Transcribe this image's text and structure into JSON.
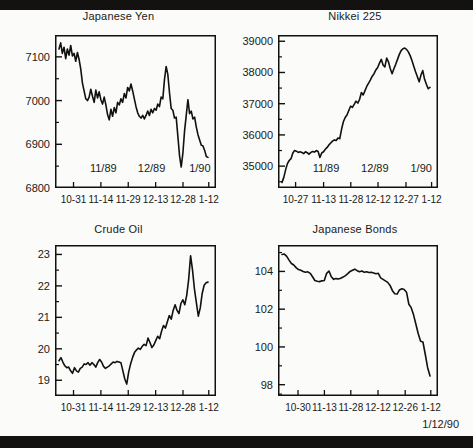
{
  "figure": {
    "caption": "1/12/90",
    "band_color": "#141210",
    "paper_color": "#fbfbf9",
    "ink_color": "#111111"
  },
  "chart_data": [
    {
      "id": "japanese-yen",
      "type": "line",
      "title": "Japanese Yen",
      "xlabel": "",
      "ylabel": "",
      "ylim": [
        6800,
        7150
      ],
      "yticks": [
        6800,
        6900,
        7000,
        7100
      ],
      "ytick_labels": [
        "6800",
        "6900",
        "7000",
        "7100"
      ],
      "minor_yticks": [
        6850,
        6950,
        7050,
        7150
      ],
      "grid": false,
      "legend": "none",
      "inner_xlabels": [
        "11/89",
        "12/89",
        "1/90"
      ],
      "inner_xlabel_positions": [
        0.3,
        0.6,
        0.9
      ],
      "xtick_labels": [
        "10-31",
        "11-14",
        "11-29",
        "12-13",
        "12-28",
        "1-12"
      ],
      "xtick_positions": [
        0.115,
        0.285,
        0.455,
        0.625,
        0.795,
        0.955
      ],
      "values": [
        7118,
        7132,
        7108,
        7122,
        7096,
        7118,
        7104,
        7126,
        7102,
        7108,
        7090,
        7110,
        7094,
        7072,
        7040,
        7022,
        7004,
        7000,
        7008,
        7026,
        7010,
        6996,
        7024,
        7006,
        7020,
        7002,
        6992,
        7008,
        6990,
        6968,
        6956,
        6980,
        6964,
        6984,
        6972,
        6996,
        6990,
        7004,
        6996,
        7016,
        7006,
        7030,
        7022,
        7038,
        7022,
        7004,
        6986,
        6972,
        6964,
        6960,
        6966,
        6958,
        6966,
        6976,
        6966,
        6980,
        6972,
        6982,
        6978,
        6992,
        6986,
        7008,
        7004,
        7048,
        7078,
        7060,
        7018,
        6982,
        6978,
        6960,
        6962,
        6918,
        6874,
        6848,
        6880,
        6930,
        6966,
        7002,
        6970,
        6976,
        6958,
        6962,
        6940,
        6922,
        6910,
        6898,
        6896,
        6886,
        6872,
        6870
      ]
    },
    {
      "id": "nikkei-225",
      "type": "line",
      "title": "Nikkei 225",
      "xlabel": "",
      "ylabel": "",
      "ylim": [
        34300,
        39200
      ],
      "yticks": [
        35000,
        36000,
        37000,
        38000,
        39000
      ],
      "ytick_labels": [
        "35000",
        "36000",
        "37000",
        "38000",
        "39000"
      ],
      "minor_yticks": [
        34500,
        35500,
        36500,
        37500,
        38500
      ],
      "grid": false,
      "legend": "none",
      "inner_xlabels": [
        "11/89",
        "12/89",
        "1/90"
      ],
      "inner_xlabel_positions": [
        0.3,
        0.605,
        0.895
      ],
      "xtick_labels": [
        "10-27",
        "11-13",
        "11-28",
        "12-12",
        "12-27",
        "1-12"
      ],
      "xtick_positions": [
        0.11,
        0.285,
        0.455,
        0.625,
        0.8,
        0.96
      ],
      "values": [
        34480,
        34640,
        34880,
        35080,
        35180,
        35240,
        35420,
        35500,
        35480,
        35440,
        35460,
        35440,
        35400,
        35460,
        35430,
        35380,
        35440,
        35470,
        35450,
        35500,
        35470,
        35280,
        35420,
        35460,
        35540,
        35600,
        35680,
        35740,
        35800,
        35840,
        35820,
        35900,
        35880,
        36180,
        36420,
        36560,
        36640,
        36780,
        36920,
        36880,
        36980,
        37080,
        37020,
        37140,
        37360,
        37280,
        37420,
        37560,
        37660,
        37760,
        37880,
        37960,
        38080,
        38160,
        38300,
        38420,
        38240,
        38180,
        38460,
        38340,
        38120,
        37960,
        38120,
        38260,
        38420,
        38580,
        38700,
        38760,
        38780,
        38740,
        38660,
        38540,
        38380,
        38200,
        38020,
        37860,
        37700,
        37920,
        38060,
        37780,
        37620,
        37480,
        37520
      ]
    },
    {
      "id": "crude-oil",
      "type": "line",
      "title": "Crude Oil",
      "xlabel": "",
      "ylabel": "",
      "ylim": [
        18.5,
        23.3
      ],
      "yticks": [
        19,
        20,
        21,
        22,
        23
      ],
      "ytick_labels": [
        "19",
        "20",
        "21",
        "22",
        "23"
      ],
      "minor_yticks": [
        18.5,
        19.5,
        20.5,
        21.5,
        22.5
      ],
      "grid": false,
      "legend": "none",
      "inner_xlabels": [],
      "inner_xlabel_positions": [],
      "xtick_labels": [
        "10-31",
        "11-14",
        "11-29",
        "12-13",
        "12-28",
        "1-12"
      ],
      "xtick_positions": [
        0.115,
        0.285,
        0.455,
        0.625,
        0.795,
        0.955
      ],
      "values": [
        19.62,
        19.72,
        19.58,
        19.46,
        19.4,
        19.42,
        19.3,
        19.22,
        19.4,
        19.3,
        19.26,
        19.38,
        19.42,
        19.52,
        19.5,
        19.56,
        19.48,
        19.56,
        19.5,
        19.42,
        19.56,
        19.66,
        19.58,
        19.44,
        19.38,
        19.42,
        19.46,
        19.52,
        19.58,
        19.56,
        19.6,
        19.58,
        19.56,
        19.3,
        19.04,
        18.88,
        19.26,
        19.52,
        19.72,
        19.88,
        19.96,
        20.02,
        19.98,
        20.08,
        20.14,
        20.1,
        20.34,
        20.2,
        20.04,
        20.12,
        20.26,
        20.4,
        20.32,
        20.56,
        20.74,
        20.66,
        20.86,
        21.06,
        20.94,
        21.22,
        21.4,
        21.22,
        21.12,
        21.44,
        21.56,
        21.4,
        21.7,
        22.2,
        22.96,
        22.5,
        21.9,
        21.46,
        21.04,
        21.3,
        21.76,
        22.02,
        22.1,
        22.12
      ]
    },
    {
      "id": "japanese-bonds",
      "type": "line",
      "title": "Japanese Bonds",
      "xlabel": "",
      "ylabel": "",
      "ylim": [
        97.4,
        105.4
      ],
      "yticks": [
        98,
        100,
        102,
        104
      ],
      "ytick_labels": [
        "98",
        "100",
        "102",
        "104"
      ],
      "minor_yticks": [
        97.5,
        99,
        101,
        103,
        105
      ],
      "grid": false,
      "legend": "none",
      "inner_xlabels": [],
      "inner_xlabel_positions": [],
      "xtick_labels": [
        "10-30",
        "11-13",
        "11-28",
        "12-12",
        "12-26",
        "1-12"
      ],
      "xtick_positions": [
        0.125,
        0.29,
        0.455,
        0.625,
        0.795,
        0.955
      ],
      "values": [
        104.9,
        104.92,
        104.8,
        104.6,
        104.42,
        104.34,
        104.2,
        104.1,
        104.06,
        104.0,
        103.96,
        103.98,
        103.9,
        103.72,
        103.52,
        103.48,
        103.46,
        103.5,
        103.52,
        103.9,
        104.02,
        103.72,
        103.58,
        103.62,
        103.6,
        103.64,
        103.7,
        103.78,
        103.88,
        104.0,
        104.06,
        104.12,
        104.04,
        103.98,
        104.02,
        103.96,
        103.98,
        103.94,
        103.96,
        103.92,
        103.88,
        103.9,
        103.66,
        103.58,
        103.5,
        103.42,
        103.26,
        102.98,
        102.82,
        102.8,
        103.02,
        103.08,
        103.04,
        102.9,
        102.26,
        102.08,
        101.7,
        101.2,
        100.7,
        100.3,
        100.26,
        99.6,
        98.9,
        98.46
      ]
    }
  ]
}
